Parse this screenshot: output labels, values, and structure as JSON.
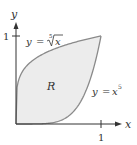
{
  "diagram": {
    "axes": {
      "x_label": "x",
      "y_label": "y",
      "x_tick": "1",
      "y_tick": "1"
    },
    "region_label": "R",
    "curves": [
      {
        "name": "upper",
        "label_y": "y",
        "label_eq": "=",
        "label_radical_index": "5",
        "label_radicand": "x",
        "expression": "y = x^(1/5)"
      },
      {
        "name": "lower",
        "label_y": "y",
        "label_eq": "=",
        "label_base": "x",
        "label_exp": "5",
        "expression": "y = x^5"
      }
    ],
    "domain": [
      0,
      1
    ],
    "colors": {
      "fill": "#ececec",
      "curve": "#8a8a8a",
      "axis": "#333333"
    }
  }
}
